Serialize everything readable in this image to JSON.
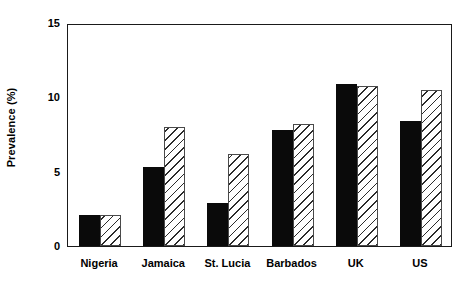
{
  "chart_data": {
    "type": "bar",
    "title": "",
    "subtitle": "",
    "xlabel": "",
    "ylabel": "Prevalence (%)",
    "categories": [
      "Nigeria",
      "Jamaica",
      "St. Lucia",
      "Barbados",
      "UK",
      "US"
    ],
    "series": [
      {
        "name": "series-1",
        "style": "solid-black",
        "values": [
          2.1,
          5.3,
          2.9,
          7.8,
          10.9,
          8.4
        ]
      },
      {
        "name": "series-2",
        "style": "white-diagonal-hatch",
        "values": [
          2.1,
          8.0,
          6.2,
          8.2,
          10.75,
          10.5
        ]
      }
    ],
    "ylim": [
      0,
      15
    ],
    "yticks": [
      0,
      5,
      10,
      15
    ],
    "ytick_labels": [
      "0",
      "5",
      "10",
      "15"
    ],
    "grid": false,
    "legend": "none"
  }
}
